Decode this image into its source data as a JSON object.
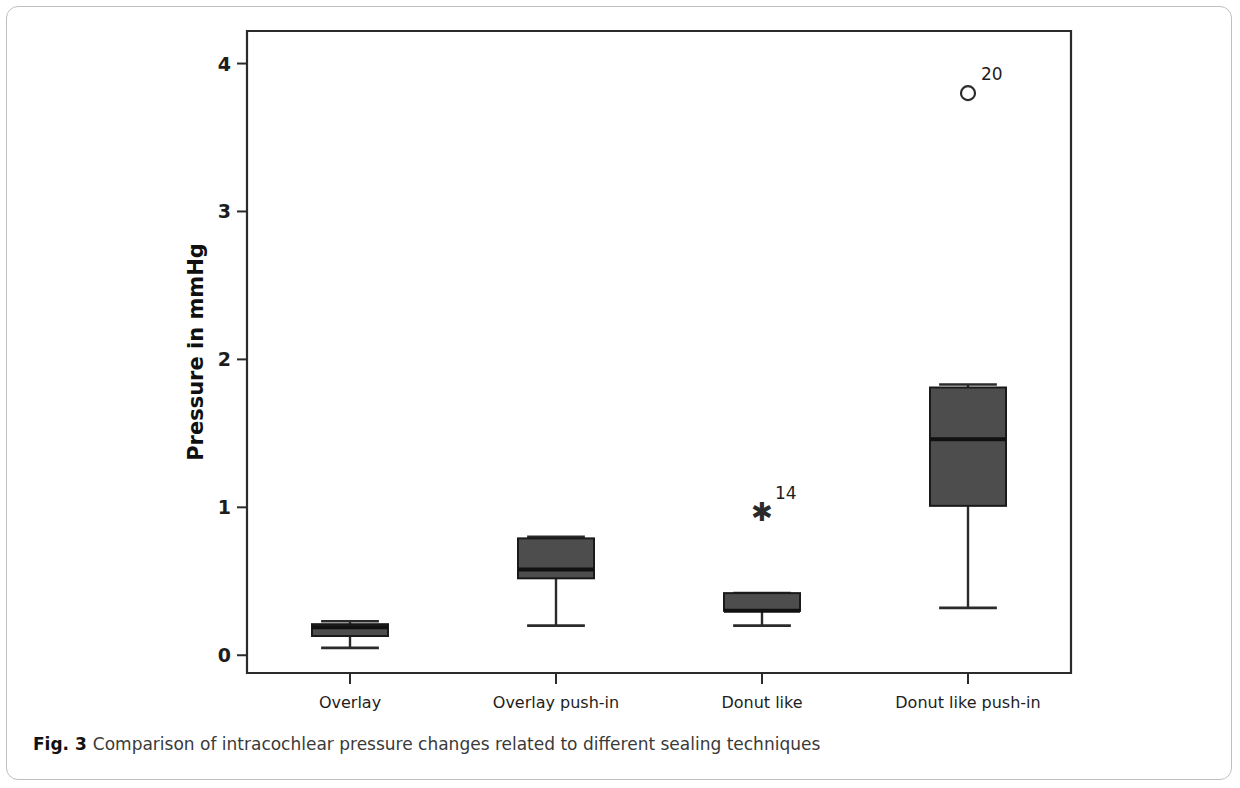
{
  "figure": {
    "caption_label": "Fig. 3",
    "caption_text": "Comparison of intracochlear pressure changes related to different sealing techniques"
  },
  "chart_data": {
    "type": "box",
    "title": "",
    "xlabel": "Condition",
    "ylabel": "Pressure in mmHg",
    "ylim": [
      -0.12,
      4.22
    ],
    "yticks": [
      0,
      1,
      2,
      3,
      4
    ],
    "ytick_labels": [
      "0",
      "1",
      "2",
      "3",
      "4"
    ],
    "grid": false,
    "legend": "none",
    "categories": [
      "Overlay",
      "Overlay push-in",
      "Donut like",
      "Donut like push-in"
    ],
    "boxes": [
      {
        "category": "Overlay",
        "whisker_low": 0.05,
        "q1": 0.13,
        "median": 0.19,
        "q3": 0.21,
        "whisker_high": 0.23,
        "outliers": []
      },
      {
        "category": "Overlay push-in",
        "whisker_low": 0.2,
        "q1": 0.52,
        "median": 0.58,
        "q3": 0.79,
        "whisker_high": 0.8,
        "outliers": []
      },
      {
        "category": "Donut like",
        "whisker_low": 0.2,
        "q1": 0.3,
        "median": 0.3,
        "q3": 0.42,
        "whisker_high": 0.42,
        "outliers": [
          {
            "value": 0.97,
            "marker": "star",
            "label": "14"
          }
        ]
      },
      {
        "category": "Donut like push-in",
        "whisker_low": 0.32,
        "q1": 1.01,
        "median": 1.46,
        "q3": 1.81,
        "whisker_high": 1.83,
        "outliers": [
          {
            "value": 3.8,
            "marker": "circle",
            "label": "20"
          }
        ]
      }
    ],
    "colors": {
      "box_fill": "#4d4d4d",
      "box_stroke": "#1a1a1a",
      "median": "#111111",
      "whisker": "#2b2b2b",
      "axis": "#2b2b2b",
      "background": "#ffffff"
    }
  }
}
